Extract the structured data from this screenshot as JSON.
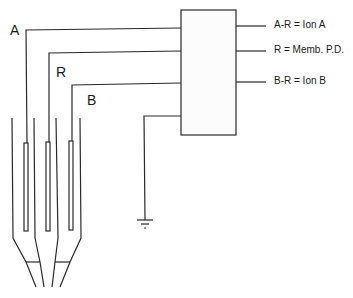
{
  "diagram": {
    "electrode_labels": {
      "a": "A",
      "r": "R",
      "b": "B"
    },
    "outputs": [
      {
        "label": "A-R = Ion A"
      },
      {
        "label": "R = Memb. P.D."
      },
      {
        "label": "B-R = Ion B"
      }
    ],
    "components": {
      "amplifier_box": "amplifier",
      "ground": "ground-symbol"
    },
    "colors": {
      "line": "#2a2a2a",
      "background": "#ffffff"
    }
  }
}
